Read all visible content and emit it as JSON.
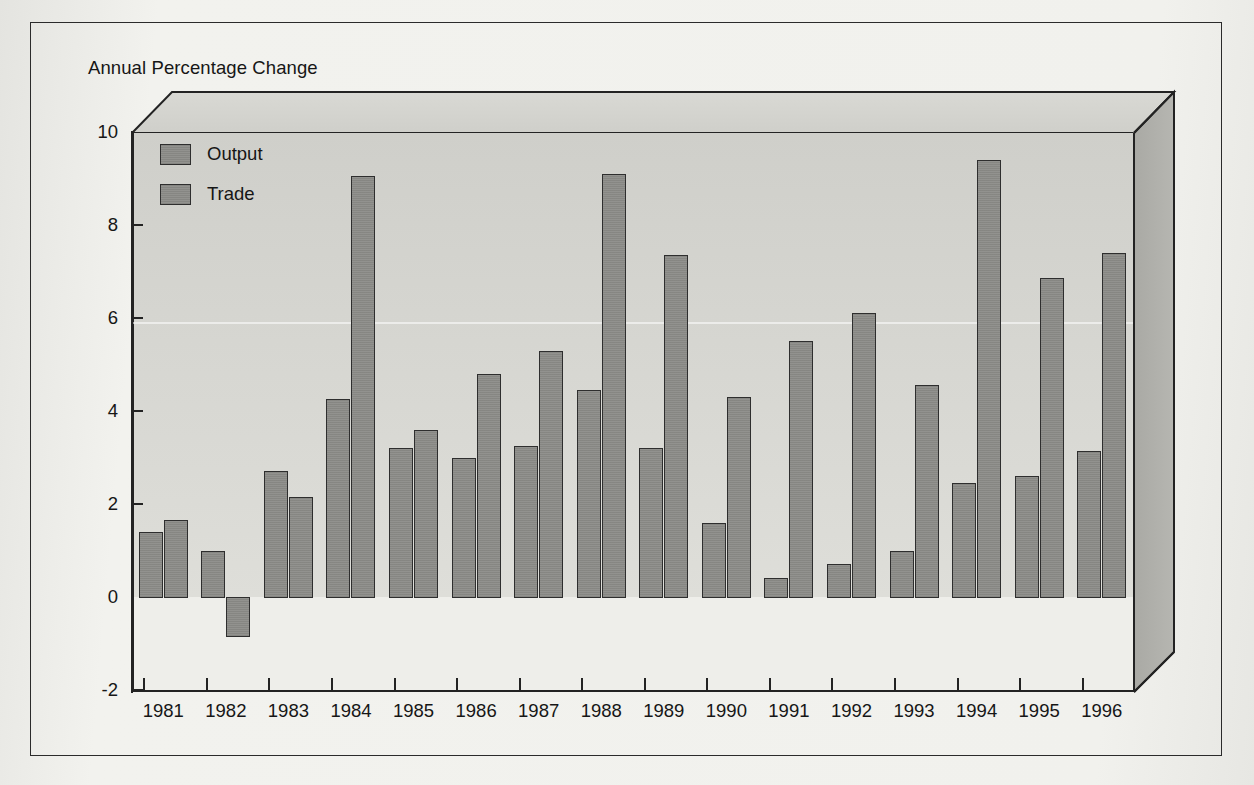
{
  "figure": {
    "title": "Annual Percentage Change",
    "frame_color": "#2b2b2b",
    "page_background": "#efefec"
  },
  "legend": {
    "position": "top-left-inside",
    "entries": [
      {
        "label": "Output",
        "color": "#8e8e8a",
        "swatch_name": "legend-swatch-output"
      },
      {
        "label": "Trade",
        "color": "#8e8e8a",
        "swatch_name": "legend-swatch-trade"
      }
    ]
  },
  "axes": {
    "y_ticks": [
      "-2",
      "0",
      "2",
      "4",
      "6",
      "8",
      "10"
    ],
    "y_min": -2,
    "y_max": 10,
    "x_ticks": [
      "1981",
      "1982",
      "1983",
      "1984",
      "1985",
      "1986",
      "1987",
      "1988",
      "1989",
      "1990",
      "1991",
      "1992",
      "1993",
      "1994",
      "1995",
      "1996"
    ],
    "grid": "none"
  },
  "chart_data": {
    "type": "bar",
    "title": "Annual Percentage Change",
    "xlabel": "",
    "ylabel": "Annual Percentage Change",
    "ylim": [
      -2,
      10
    ],
    "ytick_step": 2,
    "grid": false,
    "legend_position": "upper left",
    "categories": [
      "1981",
      "1982",
      "1983",
      "1984",
      "1985",
      "1986",
      "1987",
      "1988",
      "1989",
      "1990",
      "1991",
      "1992",
      "1993",
      "1994",
      "1995",
      "1996"
    ],
    "series": [
      {
        "name": "Output",
        "color": "#8e8e8a",
        "values": [
          1.4,
          1.0,
          2.7,
          4.25,
          3.2,
          3.0,
          3.25,
          4.45,
          3.2,
          1.6,
          0.4,
          0.7,
          1.0,
          2.45,
          2.6,
          3.15
        ]
      },
      {
        "name": "Trade",
        "color": "#8e8e8a",
        "values": [
          1.65,
          -0.85,
          2.15,
          9.05,
          3.6,
          4.8,
          5.3,
          9.1,
          7.35,
          4.3,
          5.5,
          6.1,
          4.55,
          9.4,
          6.85,
          7.4
        ]
      }
    ]
  }
}
